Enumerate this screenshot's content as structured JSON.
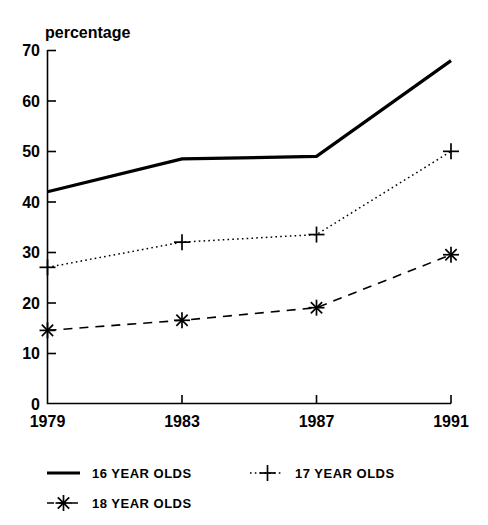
{
  "chart_data": {
    "type": "line",
    "title": "",
    "ylabel": "percentage",
    "xlabel": "",
    "x": [
      1979,
      1983,
      1987,
      1991
    ],
    "xtick_labels": [
      "1979",
      "1983",
      "1987",
      "1991"
    ],
    "ytick_labels": [
      "0",
      "10",
      "20",
      "30",
      "40",
      "50",
      "60",
      "70"
    ],
    "ytick_values": [
      0,
      10,
      20,
      30,
      40,
      50,
      60,
      70
    ],
    "ylim": [
      0,
      70
    ],
    "grid": false,
    "legend_position": "below",
    "series": [
      {
        "name": "16 YEAR OLDS",
        "values": [
          42,
          48.5,
          49,
          68
        ],
        "style": "solid",
        "marker": "none",
        "color": "#000000"
      },
      {
        "name": "17 YEAR OLDS",
        "values": [
          27,
          32,
          33.5,
          50
        ],
        "style": "dotted",
        "marker": "plus",
        "color": "#000000"
      },
      {
        "name": "18 YEAR OLDS",
        "values": [
          14.5,
          16.5,
          19,
          29.5
        ],
        "style": "dashed",
        "marker": "star",
        "color": "#000000"
      }
    ]
  },
  "legend": {
    "entries": [
      {
        "label": "16 YEAR OLDS",
        "style": "solid",
        "marker": "none"
      },
      {
        "label": "17 YEAR OLDS",
        "style": "dotted",
        "marker": "plus"
      },
      {
        "label": "18 YEAR OLDS",
        "style": "dashed",
        "marker": "star"
      }
    ]
  },
  "axes": {
    "y_axis_title": "percentage",
    "y_ticks": [
      "70",
      "60",
      "50",
      "40",
      "30",
      "20",
      "10",
      "0"
    ],
    "x_ticks": [
      "1979",
      "1983",
      "1987",
      "1991"
    ]
  }
}
